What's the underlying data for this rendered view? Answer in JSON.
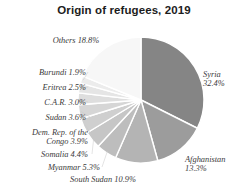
{
  "chart_data": {
    "type": "pie",
    "title": "Origin of refugees, 2019",
    "xlabel": "",
    "ylabel": "",
    "units": "percent",
    "legend": "none",
    "grid": false,
    "start_angle_deg": 0,
    "direction": "clockwise",
    "categories": [
      "Syria",
      "Afghanistan",
      "South Sudan",
      "Myanmar",
      "Somalia",
      "Dem. Rep. of the Congo",
      "Sudan",
      "C.A.R.",
      "Eritrea",
      "Burundi",
      "Others"
    ],
    "values": [
      32.4,
      13.3,
      10.9,
      5.3,
      4.4,
      3.9,
      3.6,
      3.0,
      2.5,
      1.9,
      18.8
    ],
    "colors": [
      "#858585",
      "#9c9c9c",
      "#b4b4b4",
      "#bdbdbd",
      "#c6c6c6",
      "#cfcfcf",
      "#d6d6d6",
      "#dedede",
      "#e5e5e5",
      "#ececec",
      "#f7f7f7"
    ],
    "slice_divider_color": "#ffffff",
    "labels": [
      {
        "id": "syria",
        "text": "Syria\n32.4%"
      },
      {
        "id": "afghanistan",
        "text": "Afghanistan\n13.3%"
      },
      {
        "id": "southsudan",
        "text": "South Sudan 10.9%"
      },
      {
        "id": "myanmar",
        "text": "Myanmar 5.3%"
      },
      {
        "id": "somalia",
        "text": "Somalia 4.4%"
      },
      {
        "id": "drc",
        "text": "Dem. Rep. of the\nCongo 3.9%"
      },
      {
        "id": "sudan",
        "text": "Sudan 3.6%"
      },
      {
        "id": "car",
        "text": "C.A.R. 3.0%"
      },
      {
        "id": "eritrea",
        "text": "Eritrea 2.5%"
      },
      {
        "id": "burundi",
        "text": "Burundi 1.9%"
      },
      {
        "id": "others",
        "text": "Others 18.8%"
      }
    ],
    "geometry": {
      "cx": 141,
      "cy": 100,
      "r": 63
    }
  }
}
